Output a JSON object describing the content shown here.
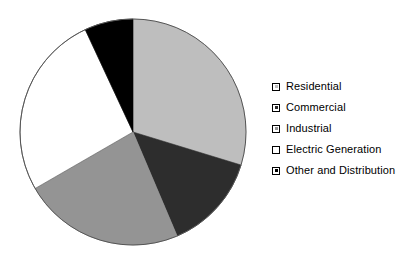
{
  "chart_data": {
    "type": "pie",
    "title": "",
    "subtitle": "",
    "legend_position": "right",
    "categories": [
      "Residential",
      "Commercial",
      "Industrial",
      "Electric Generation",
      "Other and Distribution"
    ],
    "values": [
      29.7,
      13.9,
      23.1,
      26.4,
      6.9
    ],
    "units": "percent",
    "colors": [
      "#bebebe",
      "#2d2d2d",
      "#949494",
      "#ffffff",
      "#000000"
    ],
    "slice_angles_deg": [
      {
        "label": "Residential",
        "start": 0,
        "end": 107
      },
      {
        "label": "Commercial",
        "start": 107,
        "end": 157
      },
      {
        "label": "Industrial",
        "start": 157,
        "end": 240
      },
      {
        "label": "Electric Generation",
        "start": 240,
        "end": 335
      },
      {
        "label": "Other and Distribution",
        "start": 335,
        "end": 360
      }
    ],
    "start_angle_deg": 0,
    "direction": "clockwise",
    "grid": false,
    "xlabel": "",
    "ylabel": "",
    "data_labels_shown": false
  },
  "pie": {
    "center_x": 133,
    "center_y": 132,
    "radius": 113,
    "outline_color": "#555555"
  },
  "legend": {
    "items": [
      {
        "label": "Residential",
        "color": "#bebebe"
      },
      {
        "label": "Commercial",
        "color": "#2d2d2d"
      },
      {
        "label": "Industrial",
        "color": "#949494"
      },
      {
        "label": "Electric Generation",
        "color": "#ffffff"
      },
      {
        "label": "Other and Distribution",
        "color": "#000000"
      }
    ]
  }
}
